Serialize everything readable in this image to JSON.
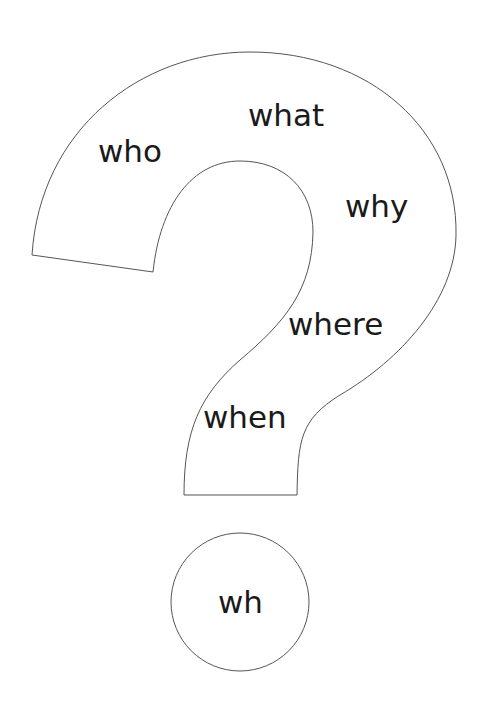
{
  "diagram": {
    "words": {
      "who": "who",
      "what": "what",
      "why": "why",
      "where": "where",
      "when": "when",
      "dot": "wh"
    },
    "colors": {
      "outline": "#555555",
      "text": "#1a1a1a",
      "background": "#ffffff"
    }
  }
}
